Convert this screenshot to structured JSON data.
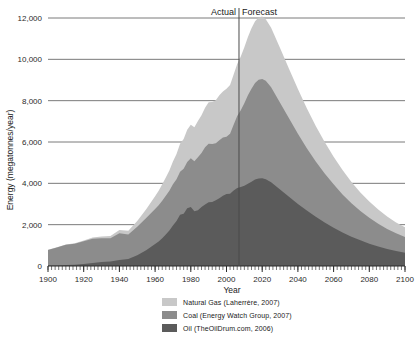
{
  "chart_data": {
    "type": "area",
    "stacked": true,
    "title": "",
    "xlabel": "Year",
    "ylabel": "Energy (megatonnes/year)",
    "xlim": [
      1900,
      2100
    ],
    "ylim": [
      0,
      12000
    ],
    "xticks": [
      1900,
      1920,
      1940,
      1960,
      1980,
      2000,
      2020,
      2040,
      2060,
      2080,
      2100
    ],
    "xticklabels": [
      "1900",
      "1920",
      "1940",
      "1960",
      "1980",
      "2000",
      "2020",
      "2040",
      "2060",
      "2080",
      "2100"
    ],
    "yticks": [
      0,
      2000,
      4000,
      6000,
      8000,
      10000,
      12000
    ],
    "yticklabels": [
      "0",
      "2,000",
      "4,000",
      "6,000",
      "8,000",
      "10,000",
      "12,000"
    ],
    "grid": "horizontal",
    "legend_position": "bottom-center",
    "annotations": [
      {
        "name": "actual-label",
        "text": "Actual",
        "x": 2007,
        "align": "right"
      },
      {
        "name": "forecast-label",
        "text": "Forecast",
        "x": 2007,
        "align": "left"
      },
      {
        "name": "actual-forecast-divider",
        "x": 2007
      }
    ],
    "x": [
      1900,
      1905,
      1910,
      1915,
      1920,
      1925,
      1930,
      1935,
      1940,
      1945,
      1950,
      1955,
      1960,
      1962,
      1964,
      1966,
      1968,
      1970,
      1972,
      1974,
      1976,
      1978,
      1980,
      1982,
      1984,
      1986,
      1988,
      1990,
      1992,
      1994,
      1996,
      1998,
      2000,
      2002,
      2004,
      2006,
      2008,
      2010,
      2012,
      2014,
      2016,
      2018,
      2020,
      2022,
      2025,
      2030,
      2035,
      2040,
      2045,
      2050,
      2055,
      2060,
      2065,
      2070,
      2075,
      2080,
      2085,
      2090,
      2095,
      2100
    ],
    "series": [
      {
        "name": "Oil (TheOilDrum.com, 2006)",
        "color": "#5b5b5b",
        "values": [
          20,
          30,
          45,
          60,
          95,
          140,
          190,
          220,
          290,
          340,
          520,
          760,
          1060,
          1180,
          1340,
          1520,
          1720,
          1960,
          2180,
          2480,
          2530,
          2790,
          2850,
          2650,
          2700,
          2850,
          2980,
          3080,
          3100,
          3180,
          3280,
          3400,
          3480,
          3500,
          3650,
          3780,
          3820,
          3880,
          3980,
          4080,
          4180,
          4230,
          4250,
          4200,
          4050,
          3700,
          3350,
          3000,
          2680,
          2380,
          2100,
          1850,
          1620,
          1420,
          1240,
          1080,
          940,
          820,
          720,
          640
        ]
      },
      {
        "name": "Coal (Energy Watch Group, 2007)",
        "color": "#8c8c8c",
        "values": [
          760,
          860,
          980,
          1020,
          1100,
          1180,
          1150,
          1120,
          1300,
          1180,
          1380,
          1560,
          1700,
          1760,
          1820,
          1880,
          1920,
          2000,
          2020,
          2080,
          2180,
          2240,
          2360,
          2420,
          2560,
          2620,
          2760,
          2840,
          2800,
          2760,
          2800,
          2820,
          2780,
          2900,
          3180,
          3480,
          3720,
          4000,
          4280,
          4500,
          4680,
          4780,
          4800,
          4760,
          4600,
          4200,
          3800,
          3400,
          3020,
          2680,
          2380,
          2100,
          1840,
          1620,
          1420,
          1250,
          1100,
          970,
          860,
          760
        ]
      },
      {
        "name": "Natural Gas (Laherrère, 2007)",
        "color": "#c8c8c8",
        "values": [
          8,
          12,
          18,
          26,
          40,
          60,
          85,
          110,
          150,
          190,
          280,
          420,
          620,
          700,
          790,
          880,
          980,
          1100,
          1220,
          1360,
          1440,
          1560,
          1620,
          1640,
          1760,
          1820,
          1920,
          2000,
          2040,
          2080,
          2180,
          2220,
          2320,
          2360,
          2440,
          2520,
          2600,
          2700,
          2820,
          2920,
          2980,
          3020,
          3020,
          2980,
          2880,
          2650,
          2400,
          2160,
          1930,
          1720,
          1520,
          1340,
          1180,
          1030,
          900,
          790,
          690,
          600,
          530,
          470
        ]
      }
    ]
  },
  "legend": {
    "items": [
      {
        "label": "Natural Gas (Laherrère, 2007)",
        "color": "#c8c8c8"
      },
      {
        "label": "Coal (Energy Watch Group, 2007)",
        "color": "#8c8c8c"
      },
      {
        "label": "Oil (TheOilDrum.com, 2006)",
        "color": "#5b5b5b"
      }
    ]
  },
  "axes": {
    "x_title": "Year",
    "y_title": "Energy (megatonnes/year)"
  },
  "colors": {
    "gridline": "#6b6b6b",
    "axis_text": "#2b2b2b",
    "divider": "#4a4a4a",
    "background": "#ffffff"
  }
}
